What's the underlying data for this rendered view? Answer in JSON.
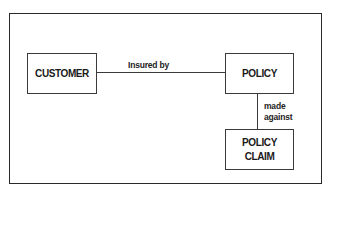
{
  "diagram": {
    "entities": {
      "customer": "CUSTOMER",
      "policy": "POLICY",
      "policy_claim_line1": "POLICY",
      "policy_claim_line2": "CLAIM"
    },
    "relationships": {
      "customer_policy": "Insured by",
      "policy_claim_line1": "made",
      "policy_claim_line2": "against"
    }
  }
}
